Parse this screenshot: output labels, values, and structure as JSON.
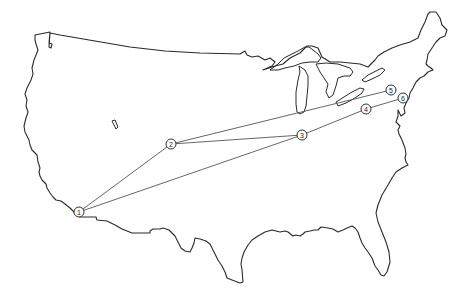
{
  "map": {
    "subject": "Contiguous United States outline with numbered route stops",
    "stroke_color": "#2a2a2a",
    "route_color": "#555555",
    "background": "#ffffff"
  },
  "nodes": [
    {
      "id": "1",
      "label": "1",
      "x": 79,
      "y": 212
    },
    {
      "id": "2",
      "label": "2",
      "x": 171,
      "y": 144
    },
    {
      "id": "3",
      "label": "3",
      "x": 302,
      "y": 135
    },
    {
      "id": "4",
      "label": "4",
      "x": 366,
      "y": 109
    },
    {
      "id": "5",
      "label": "5",
      "x": 391,
      "y": 90
    },
    {
      "id": "6",
      "label": "6",
      "x": 403,
      "y": 98
    }
  ],
  "routes": [
    {
      "from": "1",
      "to": "2"
    },
    {
      "from": "1",
      "to": "3"
    },
    {
      "from": "2",
      "to": "3"
    },
    {
      "from": "2",
      "to": "5"
    },
    {
      "from": "3",
      "to": "4"
    },
    {
      "from": "4",
      "to": "6"
    }
  ]
}
